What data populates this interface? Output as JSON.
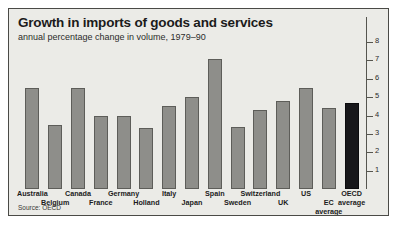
{
  "figure": {
    "title": "Growth in imports of goods and services",
    "subtitle": "annual percentage change in volume, 1979–90",
    "source": "Source: OECD",
    "bar_color": "#8e8e8a",
    "highlight_color": "#17171a",
    "background_color": "#ebebe7",
    "border_color": "#4a4a46"
  },
  "chart_data": {
    "type": "bar",
    "title": "Growth in imports of goods and services",
    "subtitle": "annual percentage change in volume, 1979–90",
    "xlabel": "",
    "ylabel": "",
    "ylim": [
      0,
      8
    ],
    "yticks": [
      1,
      2,
      3,
      4,
      5,
      6,
      7,
      8
    ],
    "grid": false,
    "legend": "none",
    "axis_position": "right",
    "source": "Source: OECD",
    "categories": [
      "Australia",
      "Belgium",
      "Canada",
      "France",
      "Germany",
      "Holland",
      "Italy",
      "Japan",
      "Spain",
      "Sweden",
      "Switzerland",
      "UK",
      "US",
      "EC average",
      "OECD average"
    ],
    "category_lines": [
      [
        "Australia"
      ],
      [
        "Belgium"
      ],
      [
        "Canada"
      ],
      [
        "France"
      ],
      [
        "Germany"
      ],
      [
        "Holland"
      ],
      [
        "Italy"
      ],
      [
        "Japan"
      ],
      [
        "Spain"
      ],
      [
        "Sweden"
      ],
      [
        "Switzerland"
      ],
      [
        "UK"
      ],
      [
        "US"
      ],
      [
        "EC",
        "average"
      ],
      [
        "OECD",
        "average"
      ]
    ],
    "label_rows": [
      "top",
      "bottom",
      "top",
      "bottom",
      "top",
      "bottom",
      "top",
      "bottom",
      "top",
      "bottom",
      "top",
      "bottom",
      "top",
      "bottom",
      "top"
    ],
    "values": [
      5.5,
      3.5,
      5.5,
      4.0,
      4.0,
      3.3,
      4.5,
      5.0,
      7.1,
      3.4,
      4.3,
      4.8,
      5.5,
      4.4,
      4.7
    ],
    "highlighted": [
      "OECD average"
    ]
  }
}
